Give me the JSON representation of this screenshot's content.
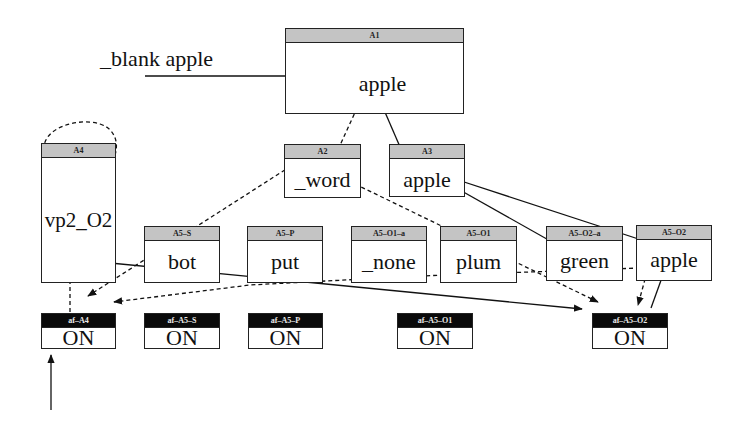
{
  "diagram": {
    "input_label": "_blank apple",
    "nodes": [
      {
        "id": "A1",
        "label": "A1",
        "value": "apple",
        "style": "gray"
      },
      {
        "id": "A4",
        "label": "A4",
        "value": "vp2_O2",
        "style": "gray"
      },
      {
        "id": "A2",
        "label": "A2",
        "value": "_word",
        "style": "gray"
      },
      {
        "id": "A3",
        "label": "A3",
        "value": "apple",
        "style": "gray"
      },
      {
        "id": "A5-S",
        "label": "A5–S",
        "value": "bot",
        "style": "gray"
      },
      {
        "id": "A5-P",
        "label": "A5–P",
        "value": "put",
        "style": "gray"
      },
      {
        "id": "A5-O1-a",
        "label": "A5–O1–a",
        "value": "_none",
        "style": "gray"
      },
      {
        "id": "A5-O1",
        "label": "A5–O1",
        "value": "plum",
        "style": "gray"
      },
      {
        "id": "A5-O2-a",
        "label": "A5–O2–a",
        "value": "green",
        "style": "gray"
      },
      {
        "id": "A5-O2",
        "label": "A5–O2",
        "value": "apple",
        "style": "gray"
      }
    ],
    "activation_nodes": [
      {
        "id": "af-A4",
        "label": "af–A4",
        "value": "ON"
      },
      {
        "id": "af-A5-S",
        "label": "af–A5–S",
        "value": "ON"
      },
      {
        "id": "af-A5-P",
        "label": "af–A5–P",
        "value": "ON"
      },
      {
        "id": "af-A5-O1",
        "label": "af–A5–O1",
        "value": "ON"
      },
      {
        "id": "af-A5-O2",
        "label": "af–A5–O2",
        "value": "ON"
      }
    ],
    "edges": [
      {
        "from": "input",
        "to": "A1",
        "style": "solid"
      },
      {
        "from": "A1",
        "to": "A2",
        "style": "dashed"
      },
      {
        "from": "A1",
        "to": "A3",
        "style": "solid"
      },
      {
        "from": "A4",
        "to": "A4",
        "style": "dashed",
        "kind": "self-loop"
      },
      {
        "from": "A2",
        "to": "af-A4",
        "style": "dashed"
      },
      {
        "from": "A2",
        "to": "af-A5-O2",
        "style": "dashed"
      },
      {
        "from": "A3",
        "to": "A5-O2-a",
        "style": "solid"
      },
      {
        "from": "A3",
        "to": "A5-O2",
        "style": "solid"
      },
      {
        "from": "A4",
        "to": "af-A5-O2",
        "style": "solid"
      },
      {
        "from": "af-A4",
        "to": "A4",
        "style": "dashed"
      },
      {
        "from": "A5-O2",
        "to": "af-A4",
        "style": "dashed"
      },
      {
        "from": "A5-O2",
        "to": "af-A5-O2",
        "style": "dashed"
      },
      {
        "from": "af-A5-O2",
        "to": "A5-O2",
        "style": "solid"
      },
      {
        "from": "external",
        "to": "af-A4",
        "style": "solid"
      }
    ]
  }
}
